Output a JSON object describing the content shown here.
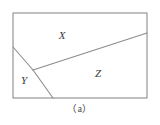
{
  "figure": {
    "caption": "（a）",
    "background_color": "#ffffff",
    "stroke_color": "#8c8c8c",
    "label_color": "#3a3a3a",
    "frame": {
      "x": 13,
      "y": 13,
      "width": 134,
      "height": 85
    },
    "labels": [
      {
        "text": "X",
        "x": 62,
        "y": 35,
        "name": "region-label-x"
      },
      {
        "text": "Y",
        "x": 24,
        "y": 80,
        "name": "region-label-y"
      },
      {
        "text": "Z",
        "x": 98,
        "y": 73,
        "name": "region-label-z"
      }
    ],
    "vertex": {
      "x": 33,
      "y": 70
    },
    "segments": [
      {
        "name": "segment-left-upper",
        "x1": 13,
        "y1": 47,
        "x2": 33,
        "y2": 70
      },
      {
        "name": "segment-lower-right",
        "x1": 33,
        "y1": 70,
        "x2": 53,
        "y2": 98
      },
      {
        "name": "segment-main-diagonal",
        "x1": 33,
        "y1": 70,
        "x2": 147,
        "y2": 33
      }
    ]
  }
}
